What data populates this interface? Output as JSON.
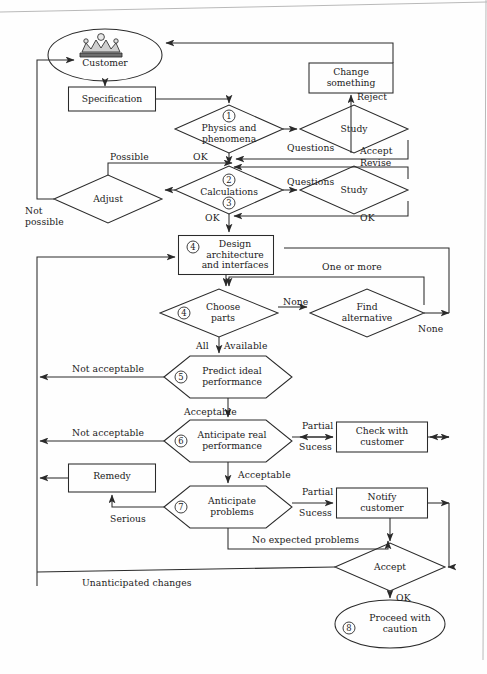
{
  "diagram": {
    "stroke_color": "#2a2a2a",
    "background": "#fefefe",
    "nodes": [
      {
        "id": "customer",
        "shape": "ellipse",
        "label": "Customer",
        "icon": "crown-icon",
        "x": 105,
        "y": 55,
        "rx": 57,
        "ry": 26
      },
      {
        "id": "specification",
        "shape": "rect",
        "label": "Specification",
        "x": 112,
        "y": 99,
        "w": 87,
        "h": 24
      },
      {
        "id": "change-something",
        "shape": "rect",
        "label": "Change\nsomething",
        "x": 351,
        "y": 78,
        "w": 84,
        "h": 30
      },
      {
        "id": "physics-and-phenomena",
        "shape": "diamond",
        "label": "Physics and\nphenomena",
        "number": "1",
        "x": 229,
        "y": 129,
        "rx": 54,
        "ry": 24
      },
      {
        "id": "study-1",
        "shape": "diamond",
        "label": "Study",
        "x": 354,
        "y": 129,
        "rx": 54,
        "ry": 24
      },
      {
        "id": "calculations",
        "shape": "diamond",
        "label": "Calculations",
        "number": "2",
        "number2": "3",
        "x": 229,
        "y": 190,
        "rx": 54,
        "ry": 24
      },
      {
        "id": "study-2",
        "shape": "diamond",
        "label": "Study",
        "x": 354,
        "y": 190,
        "rx": 54,
        "ry": 24
      },
      {
        "id": "adjust",
        "shape": "diamond",
        "label": "Adjust",
        "x": 108,
        "y": 199,
        "rx": 54,
        "ry": 24
      },
      {
        "id": "design-architecture",
        "shape": "rect",
        "label": "Design\narchitecture\nand interfaces",
        "number": "4",
        "x": 226,
        "y": 255,
        "w": 95,
        "h": 39
      },
      {
        "id": "choose-parts",
        "shape": "diamond",
        "label": "Choose\nparts",
        "number": "4",
        "x": 219,
        "y": 313,
        "rx": 59,
        "ry": 24
      },
      {
        "id": "find-alternative",
        "shape": "diamond",
        "label": "Find\nalternative",
        "x": 367,
        "y": 313,
        "rx": 57,
        "ry": 24
      },
      {
        "id": "predict-ideal-performance",
        "shape": "hexagon",
        "label": "Predict ideal\nperformance",
        "number": "5",
        "x": 228,
        "y": 377,
        "w": 128,
        "h": 42
      },
      {
        "id": "anticipate-real-performance",
        "shape": "hexagon",
        "label": "Anticipate real\nperformance",
        "number": "6",
        "x": 228,
        "y": 441,
        "w": 128,
        "h": 42
      },
      {
        "id": "check-with-customer",
        "shape": "rect",
        "label": "Check with\ncustomer",
        "x": 382,
        "y": 437,
        "w": 91,
        "h": 30
      },
      {
        "id": "anticipate-problems",
        "shape": "hexagon",
        "label": "Anticipate\nproblems",
        "number": "7",
        "x": 228,
        "y": 507,
        "w": 128,
        "h": 42
      },
      {
        "id": "notify-customer",
        "shape": "rect",
        "label": "Notify\ncustomer",
        "x": 382,
        "y": 503,
        "w": 91,
        "h": 30
      },
      {
        "id": "remedy",
        "shape": "rect",
        "label": "Remedy",
        "x": 112,
        "y": 478,
        "w": 87,
        "h": 28
      },
      {
        "id": "accept",
        "shape": "diamond",
        "label": "Accept",
        "x": 390,
        "y": 567,
        "rx": 55,
        "ry": 24
      },
      {
        "id": "proceed-with-caution",
        "shape": "ellipse",
        "label": "Proceed with\ncaution",
        "number": "8",
        "x": 390,
        "y": 624,
        "rx": 55,
        "ry": 24
      }
    ],
    "edge_labels": [
      {
        "id": "reject",
        "text": "Reject",
        "x": 357,
        "y": 92
      },
      {
        "id": "questions-1",
        "text": "Questions",
        "x": 287,
        "y": 143
      },
      {
        "id": "ok-1",
        "text": "OK",
        "x": 193,
        "y": 158
      },
      {
        "id": "accept-1",
        "text": "Accept",
        "x": 360,
        "y": 153
      },
      {
        "id": "revise",
        "text": "Revise",
        "x": 360,
        "y": 163
      },
      {
        "id": "possible",
        "text": "Possible",
        "x": 135,
        "y": 158
      },
      {
        "id": "questions-2",
        "text": "Questions",
        "x": 287,
        "y": 177
      },
      {
        "id": "not-possible",
        "text": "Not\npossible",
        "x": 25,
        "y": 208
      },
      {
        "id": "ok-2",
        "text": "OK",
        "x": 205,
        "y": 219
      },
      {
        "id": "ok-3",
        "text": "OK",
        "x": 360,
        "y": 219
      },
      {
        "id": "one-or-more",
        "text": "One or more",
        "x": 322,
        "y": 267
      },
      {
        "id": "none-1",
        "text": "None",
        "x": 291,
        "y": 305
      },
      {
        "id": "none-2",
        "text": "None",
        "x": 418,
        "y": 330
      },
      {
        "id": "all",
        "text": "All",
        "x": 201,
        "y": 345
      },
      {
        "id": "available",
        "text": "Available",
        "x": 229,
        "y": 345
      },
      {
        "id": "not-acceptable-1",
        "text": "Not acceptable",
        "x": 76,
        "y": 368
      },
      {
        "id": "acceptable-1",
        "text": "Acceptable",
        "x": 190,
        "y": 412
      },
      {
        "id": "not-acceptable-2",
        "text": "Not acceptable",
        "x": 76,
        "y": 434
      },
      {
        "id": "partial-1",
        "text": "Partial",
        "x": 318,
        "y": 426
      },
      {
        "id": "sucess-1",
        "text": "Sucess",
        "x": 315,
        "y": 446
      },
      {
        "id": "acceptable-2",
        "text": "Acceptable",
        "x": 245,
        "y": 474
      },
      {
        "id": "partial-2",
        "text": "Partial",
        "x": 318,
        "y": 492
      },
      {
        "id": "sucess-2",
        "text": "Sucess",
        "x": 315,
        "y": 512
      },
      {
        "id": "serious",
        "text": "Serious",
        "x": 114,
        "y": 518
      },
      {
        "id": "no-expected-problems",
        "text": "No expected problems",
        "x": 288,
        "y": 539
      },
      {
        "id": "unanticipated-changes",
        "text": "Unanticipated changes",
        "x": 82,
        "y": 582
      },
      {
        "id": "ok-4",
        "text": "OK",
        "x": 403,
        "y": 593
      }
    ]
  }
}
